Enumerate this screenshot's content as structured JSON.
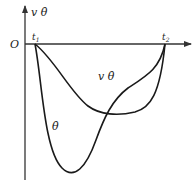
{
  "diagram": {
    "type": "function-plot",
    "y_axis_label": "v θ̇",
    "origin_label": "O",
    "x_ticks": [
      {
        "label": "t",
        "sub": "1"
      },
      {
        "label": "t",
        "sub": "2"
      }
    ],
    "curves": [
      {
        "name": "v-theta-dot",
        "label": "v θ̇",
        "shape": "shallow U from t1 to t2, minimum right of center"
      },
      {
        "name": "theta-dot",
        "label": "θ̇",
        "shape": "deep U from t1 to t2, minimum left of center"
      }
    ],
    "colors": {
      "line": "#1a1a1a",
      "axis": "#333333",
      "background": "#ffffff"
    }
  }
}
